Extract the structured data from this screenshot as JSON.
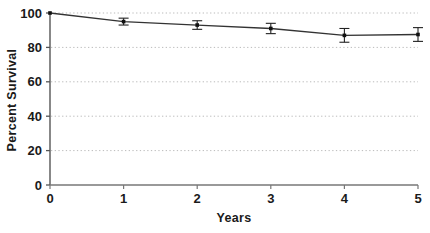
{
  "chart_data": {
    "type": "line",
    "title": "",
    "xlabel": "Years",
    "ylabel": "Percent Survival",
    "x": [
      0,
      1,
      2,
      3,
      4,
      5
    ],
    "values": [
      100,
      95,
      93,
      91,
      87,
      87.5
    ],
    "errors": [
      0,
      2,
      2.5,
      3,
      4,
      4
    ],
    "series": [
      {
        "name": "Percent Survival",
        "values": [
          100,
          95,
          93,
          91,
          87,
          87.5
        ],
        "errors": [
          0,
          2,
          2.5,
          3,
          4,
          4
        ]
      }
    ],
    "xlim": [
      0,
      5
    ],
    "ylim": [
      0,
      100
    ],
    "xticks": [
      0,
      1,
      2,
      3,
      4,
      5
    ],
    "yticks": [
      0,
      20,
      40,
      60,
      80,
      100
    ],
    "xtick_labels": [
      "0",
      "1",
      "2",
      "3",
      "4",
      "5"
    ],
    "ytick_labels": [
      "0",
      "20",
      "40",
      "60",
      "80",
      "100"
    ],
    "grid": true,
    "grid_axis": "y",
    "grid_style": "dotted",
    "legend": false,
    "legend_position": "none",
    "marker": "square",
    "error_bar_caps": true,
    "line_color": "#333333",
    "marker_color": "#111111",
    "grid_color": "#bbbbbb",
    "axis_color": "#555555",
    "text_color": "#1a1a1a",
    "background": "#ffffff"
  },
  "axes": {
    "y_title": "Percent Survival",
    "x_title": "Years"
  },
  "ticks": {
    "y": [
      {
        "label": "100",
        "value": 100
      },
      {
        "label": "80",
        "value": 80
      },
      {
        "label": "60",
        "value": 60
      },
      {
        "label": "40",
        "value": 40
      },
      {
        "label": "20",
        "value": 20
      },
      {
        "label": "0",
        "value": 0
      }
    ],
    "x": [
      {
        "label": "0",
        "value": 0
      },
      {
        "label": "1",
        "value": 1
      },
      {
        "label": "2",
        "value": 2
      },
      {
        "label": "3",
        "value": 3
      },
      {
        "label": "4",
        "value": 4
      },
      {
        "label": "5",
        "value": 5
      }
    ]
  }
}
